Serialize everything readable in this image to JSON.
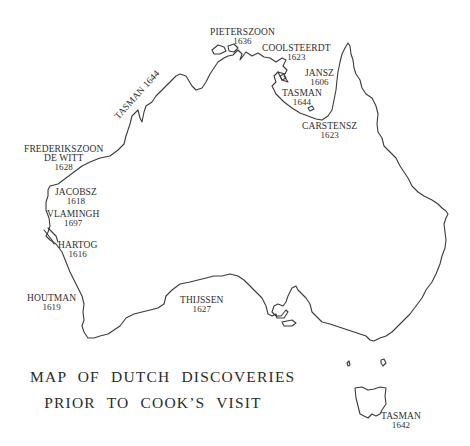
{
  "title": {
    "line1": "MAP OF DUTCH DISCOVERIES",
    "line2": "PRIOR TO COOK’S VISIT"
  },
  "discoveries": [
    {
      "name": "PIETERSZOON",
      "year": "1636"
    },
    {
      "name": "COOLSTEERDT",
      "year": "1623"
    },
    {
      "name": "JANSZ",
      "year": "1606"
    },
    {
      "name": "TASMAN",
      "year": "1644"
    },
    {
      "name": "CARSTENSZ",
      "year": "1623"
    },
    {
      "name": "TASMAN",
      "year": "1644"
    },
    {
      "name": "FREDERIKSZOON",
      "name2": "DE WITT",
      "year": "1628"
    },
    {
      "name": "JACOBSZ",
      "year": "1618"
    },
    {
      "name": "VLAMINGH",
      "year": "1697"
    },
    {
      "name": "HARTOG",
      "year": "1616"
    },
    {
      "name": "HOUTMAN",
      "year": "1619"
    },
    {
      "name": "THIJSSEN",
      "year": "1627"
    },
    {
      "name": "TASMAN",
      "year": "1642"
    }
  ],
  "style": {
    "line_color": "#3a3a3a",
    "text_color": "#2e2e2e",
    "background": "#ffffff"
  }
}
